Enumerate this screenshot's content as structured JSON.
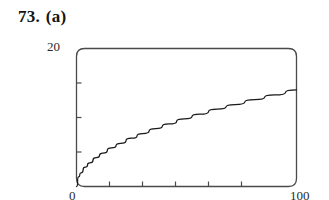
{
  "heading": {
    "number": "73.",
    "part": "(a)"
  },
  "chart_data": {
    "type": "line",
    "title": "",
    "subtitle": "",
    "xlabel": "",
    "ylabel": "",
    "xlim": [
      0,
      100
    ],
    "ylim": [
      0,
      20
    ],
    "grid": false,
    "legend": false,
    "legend_position": "none",
    "x_tick_labels": [
      "0",
      "100"
    ],
    "y_tick_labels": [
      "20"
    ],
    "x_tick_values": [
      0,
      100
    ],
    "y_tick_values": [
      20
    ],
    "x_minor_ticks": [
      15,
      30,
      45,
      60,
      75
    ],
    "y_minor_ticks": [
      5,
      10,
      15
    ],
    "annotations": [],
    "series": [
      {
        "name": "y = 1.4 * sqrt(x)",
        "x": [
          0,
          1,
          2,
          4,
          6,
          9,
          12,
          16,
          20,
          25,
          30,
          36,
          42,
          49,
          56,
          64,
          72,
          81,
          90,
          100
        ],
        "y": [
          0.0,
          1.4,
          1.98,
          2.8,
          3.43,
          4.2,
          4.85,
          5.6,
          6.26,
          7.0,
          7.67,
          8.4,
          9.07,
          9.8,
          10.48,
          11.2,
          11.88,
          12.6,
          13.28,
          14.0
        ]
      }
    ]
  },
  "colors": {
    "curve": "#1a1a1a",
    "frame": "#4a4a4a",
    "background": "#ffffff",
    "text": "#141414"
  },
  "axis_labels": {
    "y_max": "20",
    "x_min": "0",
    "x_max": "100"
  }
}
